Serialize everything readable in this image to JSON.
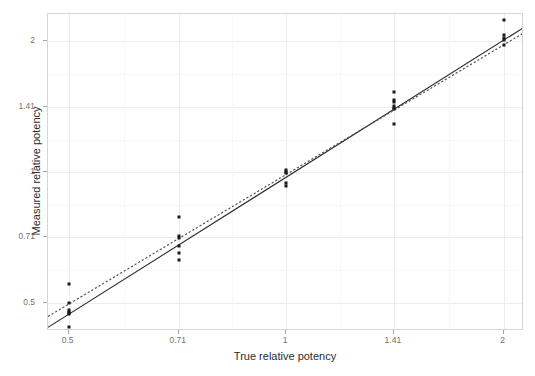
{
  "figure": {
    "width": 535,
    "height": 376,
    "background": "#ffffff",
    "panel_border_color": "#d5d5d5",
    "grid_color": "#ededed",
    "point_color": "#1a1a1a",
    "fit_line_color": "#2b2b2b",
    "reference_line_color": "#555555"
  },
  "chart_data": {
    "type": "scatter",
    "title": "",
    "xlabel": "True relative potency",
    "ylabel": "Measured relative potency",
    "xscale": "log",
    "yscale": "log",
    "grid": true,
    "legend": "none",
    "xticks": [
      0.5,
      0.71,
      1,
      1.41,
      2
    ],
    "xticklabels": [
      "0.5",
      "0.71",
      "1",
      "1.41",
      "2"
    ],
    "yticks": [
      0.5,
      0.71,
      1,
      1.41,
      2
    ],
    "yticklabels": [
      "0.5",
      "0.71",
      "1",
      "1.41",
      "2"
    ],
    "xlim": [
      0.468,
      2.135
    ],
    "ylim": [
      0.432,
      2.31
    ],
    "x": "True relative potency",
    "y": "Measured relative potency",
    "points": [
      {
        "x": 0.5,
        "y": 0.555
      },
      {
        "x": 0.5,
        "y": 0.502
      },
      {
        "x": 0.5,
        "y": 0.483
      },
      {
        "x": 0.5,
        "y": 0.479
      },
      {
        "x": 0.5,
        "y": 0.476
      },
      {
        "x": 0.5,
        "y": 0.472
      },
      {
        "x": 0.5,
        "y": 0.441
      },
      {
        "x": 0.71,
        "y": 0.791
      },
      {
        "x": 0.71,
        "y": 0.716
      },
      {
        "x": 0.71,
        "y": 0.706
      },
      {
        "x": 0.71,
        "y": 0.679
      },
      {
        "x": 0.71,
        "y": 0.653
      },
      {
        "x": 0.71,
        "y": 0.628
      },
      {
        "x": 1.0,
        "y": 1.012
      },
      {
        "x": 1.0,
        "y": 1.002
      },
      {
        "x": 1.0,
        "y": 0.995
      },
      {
        "x": 1.0,
        "y": 0.946
      },
      {
        "x": 1.0,
        "y": 0.928
      },
      {
        "x": 1.41,
        "y": 1.528
      },
      {
        "x": 1.41,
        "y": 1.468
      },
      {
        "x": 1.41,
        "y": 1.452
      },
      {
        "x": 1.41,
        "y": 1.418
      },
      {
        "x": 1.41,
        "y": 1.405
      },
      {
        "x": 1.41,
        "y": 1.398
      },
      {
        "x": 1.41,
        "y": 1.293
      },
      {
        "x": 2.0,
        "y": 2.236
      },
      {
        "x": 2.0,
        "y": 2.064
      },
      {
        "x": 2.0,
        "y": 2.03
      },
      {
        "x": 2.0,
        "y": 2.012
      },
      {
        "x": 2.0,
        "y": 1.958
      }
    ],
    "series": [
      {
        "name": "fitted-regression-line",
        "style": "solid",
        "color": "#2b2b2b",
        "endpoints": [
          {
            "x": 0.468,
            "y": 0.4405
          },
          {
            "x": 2.135,
            "y": 2.152
          }
        ]
      },
      {
        "name": "identity-reference-line",
        "style": "dotted",
        "color": "#555555",
        "endpoints": [
          {
            "x": 0.468,
            "y": 0.4665
          },
          {
            "x": 2.135,
            "y": 2.092
          }
        ]
      }
    ]
  },
  "axes": {
    "x": {
      "label": "True relative potency",
      "ticks": [
        {
          "value": 0.5,
          "label": "0.5"
        },
        {
          "value": 0.71,
          "label": "0.71"
        },
        {
          "value": 1,
          "label": "1"
        },
        {
          "value": 1.41,
          "label": "1.41"
        },
        {
          "value": 2,
          "label": "2"
        }
      ]
    },
    "y": {
      "label": "Measured relative potency",
      "ticks": [
        {
          "value": 0.5,
          "label": "0.5"
        },
        {
          "value": 0.71,
          "label": "0.71"
        },
        {
          "value": 1,
          "label": "1"
        },
        {
          "value": 1.41,
          "label": "1.41"
        },
        {
          "value": 2,
          "label": "2"
        }
      ]
    }
  }
}
